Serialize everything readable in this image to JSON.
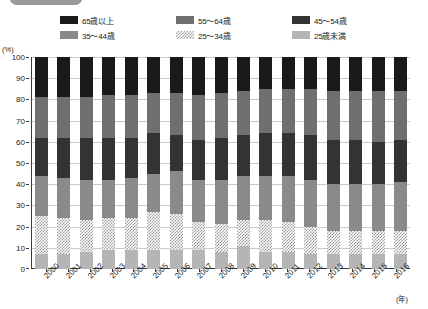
{
  "legend": {
    "items": [
      {
        "label": "65歳以上",
        "key": "age65p",
        "color": "#1a1a1a",
        "swatch": "sw-65"
      },
      {
        "label": "55〜64歳",
        "key": "age5564",
        "color": "#6f6f6f",
        "swatch": "sw-55"
      },
      {
        "label": "45〜54歳",
        "key": "age4554",
        "color": "#333333",
        "swatch": "sw-45"
      },
      {
        "label": "35〜44歳",
        "key": "age3544",
        "color": "#8a8a8a",
        "swatch": "sw-35"
      },
      {
        "label": "25〜34歳",
        "key": "age2534",
        "color": "#ffffff",
        "swatch": "sw-25"
      },
      {
        "label": "25歳未満",
        "key": "ageu25",
        "color": "#b5b5b5",
        "swatch": "sw-u25"
      }
    ]
  },
  "axes": {
    "y_unit": "(%)",
    "x_unit": "(年)",
    "y_ticks": [
      "100",
      "90",
      "80",
      "70",
      "60",
      "50",
      "40",
      "30",
      "20",
      "10",
      "0"
    ]
  },
  "chart_data": {
    "type": "bar",
    "stacked": true,
    "title": "",
    "xlabel": "(年)",
    "ylabel": "(%)",
    "ylim": [
      0,
      100
    ],
    "grid": true,
    "legend_position": "top",
    "categories": [
      "2000",
      "2001",
      "2002",
      "2003",
      "2004",
      "2005",
      "2006",
      "2007",
      "2008",
      "2009",
      "2010",
      "2011",
      "2012",
      "2013",
      "2014",
      "2015",
      "2016"
    ],
    "series": [
      {
        "name": "25歳未満",
        "values": [
          7,
          7,
          8,
          9,
          9,
          9,
          9,
          9,
          8,
          11,
          8,
          8,
          7,
          7,
          7,
          7,
          7
        ]
      },
      {
        "name": "25〜34歳",
        "values": [
          18,
          17,
          15,
          15,
          15,
          18,
          17,
          13,
          13,
          12,
          15,
          14,
          13,
          11,
          11,
          11,
          11
        ]
      },
      {
        "name": "35〜44歳",
        "values": [
          19,
          19,
          19,
          18,
          19,
          18,
          20,
          20,
          21,
          21,
          21,
          22,
          22,
          22,
          22,
          22,
          23
        ]
      },
      {
        "name": "45〜54歳",
        "values": [
          18,
          19,
          20,
          20,
          19,
          19,
          17,
          19,
          20,
          19,
          20,
          20,
          21,
          21,
          21,
          20,
          20
        ]
      },
      {
        "name": "55〜64歳",
        "values": [
          19,
          19,
          19,
          20,
          20,
          19,
          20,
          21,
          21,
          21,
          21,
          21,
          22,
          23,
          23,
          24,
          23
        ]
      },
      {
        "name": "65歳以上",
        "values": [
          19,
          19,
          19,
          18,
          18,
          17,
          17,
          18,
          17,
          16,
          15,
          15,
          15,
          16,
          16,
          16,
          16
        ]
      }
    ]
  }
}
